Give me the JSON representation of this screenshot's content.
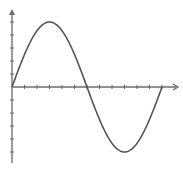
{
  "chart_data": {
    "type": "line",
    "title": "",
    "xlabel": "",
    "ylabel": "",
    "function": "sine",
    "x": [
      0,
      0.5,
      1,
      1.5,
      2,
      2.5,
      3,
      3.5,
      4,
      4.5,
      5,
      5.5,
      6,
      6.5,
      7,
      7.5,
      8,
      8.5,
      9,
      9.5,
      10,
      10.5,
      11,
      11.5,
      12
    ],
    "values": [
      0,
      2.59,
      3.54,
      4.33,
      4.83,
      5.0,
      4.83,
      4.33,
      3.54,
      2.5,
      1.29,
      0,
      -1.29,
      -2.5,
      -3.54,
      -4.33,
      -4.83,
      -5.0,
      -4.83,
      -4.33,
      -3.54,
      -2.5,
      -1.29,
      -0.65,
      0
    ],
    "series": [
      {
        "name": "sine wave",
        "color": "#555555",
        "amplitude": 5,
        "period_ticks": 12
      }
    ],
    "x_ticks_count": 12,
    "y_ticks_positive": 5,
    "y_ticks_negative": 5,
    "xlim": [
      0,
      13
    ],
    "ylim": [
      -6,
      6
    ],
    "grid": false,
    "legend": null,
    "axes_color": "#666666",
    "curve_color": "#555555"
  }
}
